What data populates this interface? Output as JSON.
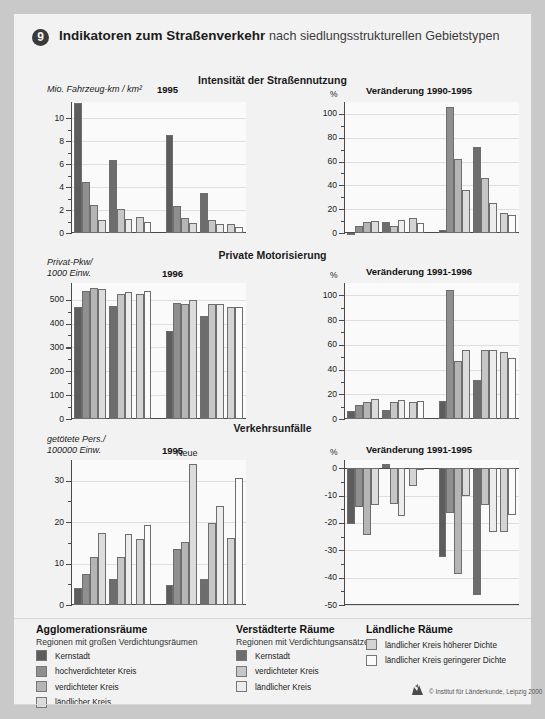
{
  "header": {
    "number": "9",
    "title": "Indikatoren zum Straßenverkehr",
    "subtitle": "nach siedlungsstrukturellen Gebietstypen"
  },
  "rows": [
    {
      "row_title": "Intensität der Straßennutzung",
      "left": {
        "ylabel": "Mio. Fahrzeug-km / km²",
        "year": "1995",
        "group_labels": [
          "Alte Länder",
          "Neue Länder"
        ],
        "yticks": [
          "0",
          "2",
          "4",
          "6",
          "8",
          "10"
        ]
      },
      "right": {
        "yunit": "%",
        "subtitle": "Veränderung 1990-1995",
        "group_labels": [
          "Alte Länder",
          "Neue Länder"
        ],
        "yticks": [
          "0",
          "20",
          "40",
          "60",
          "80",
          "100"
        ]
      }
    },
    {
      "row_title": "Private Motorisierung",
      "left": {
        "ylabel": "Privat-Pkw/\n1000 Einw.",
        "year": "1996",
        "group_labels": [
          "Alte Länder",
          "Neue Länder"
        ],
        "yticks": [
          "0",
          "100",
          "200",
          "300",
          "400",
          "500"
        ]
      },
      "right": {
        "yunit": "%",
        "subtitle": "Veränderung 1991-1996",
        "group_labels": [
          "Alte Länder",
          "Neue Länder"
        ],
        "yticks": [
          "0",
          "20",
          "40",
          "60",
          "80",
          "100"
        ]
      }
    },
    {
      "row_title": "Verkehrsunfälle",
      "left": {
        "ylabel": "getötete Pers./\n100000 Einw.",
        "year": "1995",
        "group_labels": [
          "Alte Länder",
          "Neue\nLänder"
        ],
        "yticks": [
          "0",
          "10",
          "20",
          "30"
        ]
      },
      "right": {
        "yunit": "%",
        "subtitle": "Veränderung 1991-1995",
        "group_labels": [
          "Alte Länder",
          "Neue\nLänder"
        ],
        "yticks": [
          "0",
          "-10",
          "-20",
          "-30",
          "-40",
          "-50"
        ]
      }
    }
  ],
  "legend": {
    "columns": [
      {
        "title": "Agglomerationsräume",
        "subtitle": "Regionen mit großen Verdichtungsräumen",
        "items": [
          {
            "label": "Kernstadt",
            "color": "#5d5d5d"
          },
          {
            "label": "hochverdichteter Kreis",
            "color": "#8f8f8f"
          },
          {
            "label": "verdichteter Kreis",
            "color": "#b5b5b5"
          },
          {
            "label": "ländlicher Kreis",
            "color": "#dcdcdc"
          }
        ]
      },
      {
        "title": "Verstädterte Räume",
        "subtitle": "Regionen mit Verdichtungsansätzen",
        "items": [
          {
            "label": "Kernstadt",
            "color": "#6d6d6d"
          },
          {
            "label": "verdichteter Kreis",
            "color": "#c6c6c6"
          },
          {
            "label": "ländlicher Kreis",
            "color": "#ececec"
          }
        ]
      },
      {
        "title": "Ländliche Räume",
        "subtitle": "",
        "items": [
          {
            "label": "ländlicher Kreis höherer Dichte",
            "color": "#d4d4d4"
          },
          {
            "label": "ländlicher Kreis geringerer Dichte",
            "color": "#fbfbfb"
          }
        ]
      }
    ],
    "credit": "© Institut für Länderkunde, Leipzig 2000"
  },
  "colors": {
    "bars": [
      "#5d5d5d",
      "#8f8f8f",
      "#b5b5b5",
      "#dcdcdc",
      "#6d6d6d",
      "#c6c6c6",
      "#ececec",
      "#d4d4d4",
      "#fbfbfb"
    ],
    "plot_bg": "#fafafa",
    "axis": "#4a4a4a",
    "page_bg": "#f2f2f2"
  },
  "chart_data": [
    {
      "type": "bar",
      "title": "Intensität der Straßennutzung",
      "subtitle": "1995",
      "ylabel": "Mio. Fahrzeug-km / km²",
      "xlabel": "",
      "ylim": [
        0,
        11.4
      ],
      "yticks": [
        0,
        2,
        4,
        6,
        8,
        10
      ],
      "grid": true,
      "categories": [
        "Kernstadt (Agglo)",
        "hochverdichteter Kreis (Agglo)",
        "verdichteter Kreis (Agglo)",
        "ländlicher Kreis (Agglo)",
        "Kernstadt (Verst)",
        "verdichteter Kreis (Verst)",
        "ländlicher Kreis (Verst)",
        "ländlicher Kreis höherer Dichte",
        "ländlicher Kreis geringerer Dichte"
      ],
      "series": [
        {
          "name": "Alte Länder",
          "values": [
            11.3,
            4.4,
            2.45,
            1.15,
            6.35,
            2.05,
            1.25,
            1.35,
            0.95
          ]
        },
        {
          "name": "Neue Länder",
          "values": [
            8.5,
            2.35,
            1.3,
            0.85,
            3.45,
            1.1,
            0.8,
            0.8,
            0.55
          ]
        }
      ]
    },
    {
      "type": "bar",
      "title": "Veränderung 1990-1995",
      "ylabel": "%",
      "ylim": [
        0,
        110
      ],
      "yticks": [
        0,
        20,
        40,
        60,
        80,
        100
      ],
      "grid": true,
      "categories": [
        "Kernstadt (Agglo)",
        "hochverdichteter Kreis (Agglo)",
        "verdichteter Kreis (Agglo)",
        "ländlicher Kreis (Agglo)",
        "Kernstadt (Verst)",
        "verdichteter Kreis (Verst)",
        "ländlicher Kreis (Verst)",
        "ländlicher Kreis höherer Dichte",
        "ländlicher Kreis geringerer Dichte"
      ],
      "series": [
        {
          "name": "Alte Länder",
          "values": [
            -1,
            6,
            9.5,
            10,
            9.5,
            6,
            10.5,
            13,
            8.5
          ]
        },
        {
          "name": "Neue Länder",
          "values": [
            2.5,
            106,
            62.5,
            36.5,
            72.5,
            46,
            25,
            16.5,
            15.5
          ]
        }
      ]
    },
    {
      "type": "bar",
      "title": "Private Motorisierung",
      "subtitle": "1996",
      "ylabel": "Privat-Pkw/1000 Einw.",
      "ylim": [
        0,
        570
      ],
      "yticks": [
        0,
        100,
        200,
        300,
        400,
        500
      ],
      "grid": true,
      "categories": [
        "Kernstadt (Agglo)",
        "hochverdichteter Kreis (Agglo)",
        "verdichteter Kreis (Agglo)",
        "ländlicher Kreis (Agglo)",
        "Kernstadt (Verst)",
        "verdichteter Kreis (Verst)",
        "ländlicher Kreis (Verst)",
        "ländlicher Kreis höherer Dichte",
        "ländlicher Kreis geringerer Dichte"
      ],
      "series": [
        {
          "name": "Alte Länder",
          "values": [
            470,
            537,
            548,
            546,
            475,
            524,
            532,
            525,
            537
          ]
        },
        {
          "name": "Neue Länder",
          "values": [
            369,
            488,
            483,
            498,
            430,
            481,
            481,
            469,
            470
          ]
        }
      ]
    },
    {
      "type": "bar",
      "title": "Veränderung 1991-1996",
      "ylabel": "%",
      "ylim": [
        0,
        110
      ],
      "yticks": [
        0,
        20,
        40,
        60,
        80,
        100
      ],
      "grid": true,
      "categories": [
        "Kernstadt (Agglo)",
        "hochverdichteter Kreis (Agglo)",
        "verdichteter Kreis (Agglo)",
        "ländlicher Kreis (Agglo)",
        "Kernstadt (Verst)",
        "verdichteter Kreis (Verst)",
        "ländlicher Kreis (Verst)",
        "ländlicher Kreis höherer Dichte",
        "ländlicher Kreis geringerer Dichte"
      ],
      "series": [
        {
          "name": "Alte Länder",
          "values": [
            6.5,
            11,
            13.5,
            16,
            7,
            13.5,
            15.5,
            13.5,
            14.5
          ]
        },
        {
          "name": "Neue Länder",
          "values": [
            14.5,
            104,
            47,
            55.5,
            31.5,
            55.5,
            56,
            54.5,
            49
          ]
        }
      ]
    },
    {
      "type": "bar",
      "title": "Verkehrsunfälle",
      "subtitle": "1995",
      "ylabel": "getötete Pers./100000 Einw.",
      "ylim": [
        0,
        35
      ],
      "yticks": [
        0,
        10,
        20,
        30
      ],
      "grid": true,
      "categories": [
        "Kernstadt (Agglo)",
        "hochverdichteter Kreis (Agglo)",
        "verdichteter Kreis (Agglo)",
        "ländlicher Kreis (Agglo)",
        "Kernstadt (Verst)",
        "verdichteter Kreis (Verst)",
        "ländlicher Kreis (Verst)",
        "ländlicher Kreis höherer Dichte",
        "ländlicher Kreis geringerer Dichte"
      ],
      "series": [
        {
          "name": "Alte Länder",
          "values": [
            4.1,
            7.6,
            11.7,
            17.5,
            6.2,
            11.7,
            17.2,
            15.9,
            19.2
          ]
        },
        {
          "name": "Neue Länder",
          "values": [
            4.9,
            13.4,
            15.1,
            34.0,
            6.2,
            19.9,
            24.0,
            16.1,
            30.7
          ]
        }
      ]
    },
    {
      "type": "bar",
      "title": "Veränderung 1991-1995",
      "ylabel": "%",
      "ylim": [
        -50,
        3
      ],
      "yticks": [
        0,
        -10,
        -20,
        -30,
        -40,
        -50
      ],
      "grid": true,
      "categories": [
        "Kernstadt (Agglo)",
        "hochverdichteter Kreis (Agglo)",
        "verdichteter Kreis (Agglo)",
        "ländlicher Kreis (Agglo)",
        "Kernstadt (Verst)",
        "verdichteter Kreis (Verst)",
        "ländlicher Kreis (Verst)",
        "ländlicher Kreis höherer Dichte",
        "ländlicher Kreis geringerer Dichte"
      ],
      "series": [
        {
          "name": "Alte Länder",
          "values": [
            -20.5,
            -14,
            -24.5,
            -13.5,
            1.5,
            -13,
            -17.5,
            -6.5,
            -0.5
          ]
        },
        {
          "name": "Neue Länder",
          "values": [
            -32.5,
            -16.5,
            -38.5,
            -10,
            -46.5,
            -13.5,
            -23.5,
            -23.5,
            -17
          ]
        }
      ]
    }
  ]
}
